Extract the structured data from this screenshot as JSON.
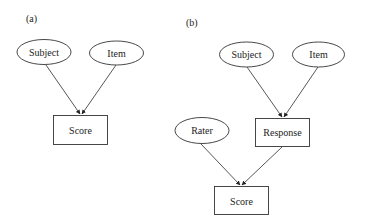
{
  "panels": [
    {
      "id": "a",
      "label": "(a)",
      "nodes": {
        "subject": {
          "text": "Subject",
          "shape": "ellipse"
        },
        "item": {
          "text": "Item",
          "shape": "ellipse"
        },
        "score": {
          "text": "Score",
          "shape": "rectangle"
        }
      },
      "edges": [
        {
          "from": "Subject",
          "to": "Score"
        },
        {
          "from": "Item",
          "to": "Score"
        }
      ]
    },
    {
      "id": "b",
      "label": "(b)",
      "nodes": {
        "subject": {
          "text": "Subject",
          "shape": "ellipse"
        },
        "item": {
          "text": "Item",
          "shape": "ellipse"
        },
        "response": {
          "text": "Response",
          "shape": "rectangle"
        },
        "rater": {
          "text": "Rater",
          "shape": "ellipse"
        },
        "score": {
          "text": "Score",
          "shape": "rectangle"
        }
      },
      "edges": [
        {
          "from": "Subject",
          "to": "Response"
        },
        {
          "from": "Item",
          "to": "Response"
        },
        {
          "from": "Rater",
          "to": "Score"
        },
        {
          "from": "Response",
          "to": "Score"
        }
      ]
    }
  ],
  "colors": {
    "stroke": "#333333",
    "text": "#222222",
    "background": "#ffffff"
  }
}
